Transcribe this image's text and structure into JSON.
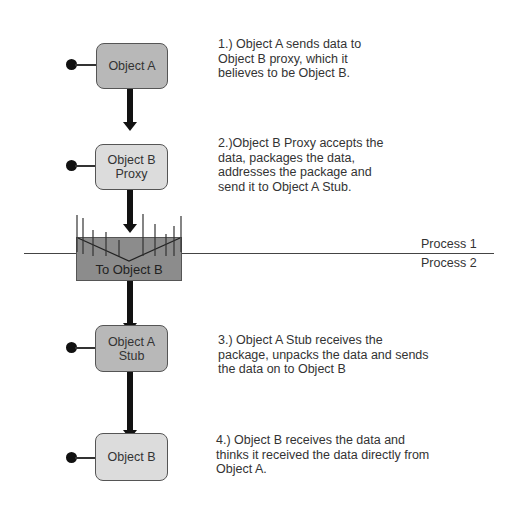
{
  "diagram": {
    "nodes": [
      {
        "id": "object-a",
        "label": "Object A"
      },
      {
        "id": "object-b-proxy",
        "label": "Object B\nProxy"
      },
      {
        "id": "channel",
        "label": "To Object B"
      },
      {
        "id": "object-a-stub",
        "label": "Object A\nStub"
      },
      {
        "id": "object-b",
        "label": "Object B"
      }
    ],
    "boundary": {
      "upper_label": "Process 1",
      "lower_label": "Process 2"
    },
    "notes": [
      "1.) Object A sends data to\nObject B proxy, which it\nbelieves to be Object B.",
      "2.)Object B Proxy accepts the\ndata, packages the data,\naddresses the package and\nsend it to Object A Stub.",
      "3.) Object A Stub receives the\npackage, unpacks the data and sends\nthe data on to Object B",
      "4.) Object B receives the data and\nthinks it received the data directly from\nObject A."
    ],
    "colors": {
      "dark_node": "#b8b8b8",
      "light_node": "#dcdcdc",
      "channel": "#8c8c8c",
      "connector": "#111111"
    }
  }
}
